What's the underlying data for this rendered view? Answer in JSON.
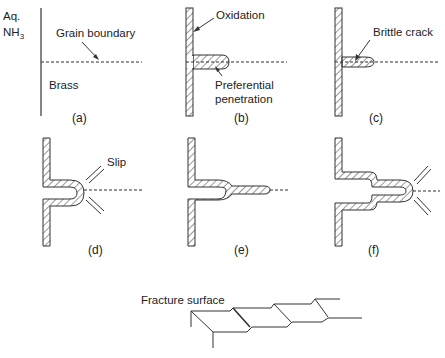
{
  "figure": {
    "panels": [
      {
        "id": "a",
        "caption": "(a)",
        "labels": {
          "env_line1": "Aq.",
          "env_line2_main": "NH",
          "env_line2_sub": "3",
          "grain_boundary": "Grain boundary",
          "material": "Brass"
        }
      },
      {
        "id": "b",
        "caption": "(b)",
        "labels": {
          "oxidation": "Oxidation",
          "pref_line1": "Preferential",
          "pref_line2": "penetration"
        }
      },
      {
        "id": "c",
        "caption": "(c)",
        "labels": {
          "brittle_crack": "Brittle crack"
        }
      },
      {
        "id": "d",
        "caption": "(d)",
        "labels": {
          "slip": "Slip"
        }
      },
      {
        "id": "e",
        "caption": "(e)",
        "labels": {}
      },
      {
        "id": "f",
        "caption": "(f)",
        "labels": {}
      }
    ],
    "fracture": {
      "label": "Fracture surface"
    }
  },
  "colors": {
    "ink": "#222222",
    "background": "#ffffff"
  }
}
